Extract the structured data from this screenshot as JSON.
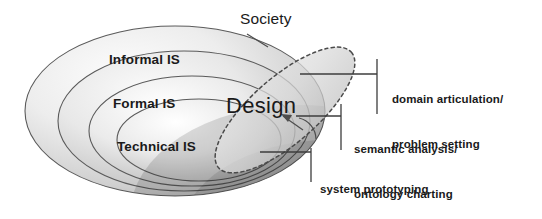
{
  "figure": {
    "rings": [
      {
        "id": "informal",
        "label": "Informal IS"
      },
      {
        "id": "formal",
        "label": "Formal IS"
      },
      {
        "id": "technical",
        "label": "Technical IS"
      }
    ],
    "outer_label": "Society",
    "overlay_label": "Design",
    "annotations": [
      {
        "id": "annot-1",
        "line1": "domain articulation/",
        "line2": "problem setting"
      },
      {
        "id": "annot-2",
        "line1": "semantic analysis/",
        "line2": "ontology charting"
      },
      {
        "id": "annot-3",
        "line1": "system prototyping",
        "line2": ""
      }
    ],
    "colors": {
      "ink": "#1a1a1a",
      "stroke": "#4d4d4d",
      "ring_light": "#f2f2f2",
      "ring_mid": "#d9d9d9",
      "ring_dark": "#9e9e9e",
      "overlay_fill": "#dcdcdc",
      "overlay_dash": "#555555",
      "background": "#ffffff"
    }
  }
}
